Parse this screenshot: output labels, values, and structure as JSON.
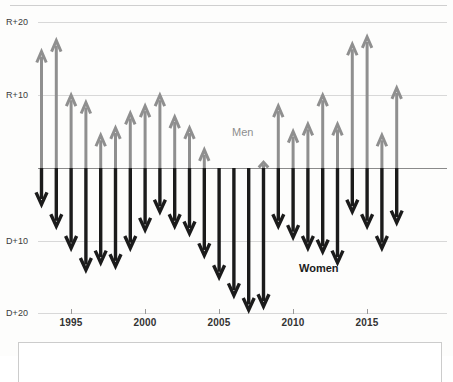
{
  "chart_data": {
    "type": "bar",
    "title": "",
    "subtitle": "",
    "xlabel": "",
    "ylabel": "",
    "grid": true,
    "legend_position": "inline-annotation",
    "axis": {
      "y_ticks": [
        {
          "label": "R+20",
          "value": 20
        },
        {
          "label": "R+10",
          "value": 10
        },
        {
          "label": "",
          "value": 0
        },
        {
          "label": "D+10",
          "value": -10
        },
        {
          "label": "D+20",
          "value": -20
        }
      ],
      "ylim": [
        -20,
        20
      ],
      "x_ticks": [
        "1995",
        "2000",
        "2005",
        "2010",
        "2015"
      ],
      "xlim": [
        1994,
        2018
      ]
    },
    "annotations": [
      {
        "text": "Men",
        "x": 2004.5,
        "y": 6.5,
        "color": "#8e8e8e"
      },
      {
        "text": "Women",
        "x": 2012.0,
        "y": -15.5,
        "color": "#1b1b1b"
      }
    ],
    "x": [
      1994,
      1995,
      1996,
      1997,
      1998,
      1999,
      2000,
      2001,
      2002,
      2003,
      2004,
      2005,
      2006,
      2007,
      2008,
      2009,
      2010,
      2011,
      2012,
      2013,
      2014,
      2015,
      2016,
      2017,
      2018
    ],
    "series": [
      {
        "name": "Men",
        "color": "#8f8f8f",
        "direction": "up",
        "values": [
          16,
          17.5,
          10,
          9,
          4.5,
          5.5,
          7.5,
          8.5,
          10,
          7,
          5.5,
          2.5,
          0,
          0,
          0,
          0.8,
          8.5,
          5,
          6,
          10,
          6,
          17,
          18,
          4.5,
          11
        ]
      },
      {
        "name": "Women",
        "color": "#1b1b1b",
        "direction": "down",
        "values": [
          -5,
          -8,
          -11,
          -14,
          -13,
          -13.5,
          -11,
          -8.5,
          -6,
          -8,
          -9,
          -12,
          -15,
          -17.5,
          -19.5,
          -19,
          -8,
          -9.5,
          -11,
          -11.5,
          -13,
          -6,
          -8,
          -11,
          -7.5
        ]
      }
    ]
  },
  "labels": {
    "y_r20": "R+20",
    "y_r10": "R+10",
    "y_d10": "D+10",
    "y_d20": "D+20",
    "men": "Men",
    "women": "Women",
    "x1995": "1995",
    "x2000": "2000",
    "x2005": "2005",
    "x2010": "2010",
    "x2015": "2015"
  }
}
